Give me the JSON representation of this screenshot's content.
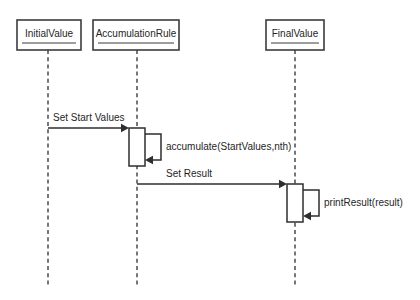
{
  "diagram": {
    "kind": "uml-sequence-diagram",
    "title": "",
    "background_color": "#ffffff",
    "stroke_color": "#2e2e2e",
    "text_color": "#1f1f1f",
    "participants": [
      {
        "id": "initial-value",
        "label": "InitialValue",
        "box": {
          "x": 17,
          "y": 20,
          "width": 64,
          "height": 30
        },
        "lifeline_x": 48,
        "lifeline_top": 50,
        "lifeline_bottom": 286
      },
      {
        "id": "accumulation-rule",
        "label": "AccumulationRule",
        "box": {
          "x": 93,
          "y": 20,
          "width": 86,
          "height": 30
        },
        "lifeline_x": 137,
        "lifeline_top": 50,
        "lifeline_bottom": 286
      },
      {
        "id": "final-value",
        "label": "FinalValue",
        "box": {
          "x": 266,
          "y": 20,
          "width": 58,
          "height": 30
        },
        "lifeline_x": 295,
        "lifeline_top": 50,
        "lifeline_bottom": 286
      }
    ],
    "activations": [
      {
        "id": "activation-accumulation-rule",
        "participant": "accumulation-rule",
        "x": 129,
        "y": 128,
        "width": 16,
        "height": 38
      },
      {
        "id": "activation-final-value",
        "participant": "final-value",
        "x": 287,
        "y": 184,
        "width": 16,
        "height": 38
      }
    ],
    "messages": [
      {
        "id": "message-set-start-values",
        "label": "Set Start Values",
        "type": "call",
        "from": "initial-value",
        "to": "accumulation-rule",
        "y": 128,
        "x_start": 48,
        "x_end": 129,
        "label_x": 53,
        "label_y": 118
      },
      {
        "id": "message-accumulate",
        "label": "accumulate(StartValues,nth)",
        "type": "self-call",
        "from": "accumulation-rule",
        "to": "accumulation-rule",
        "y_start": 134,
        "y_end": 160,
        "x_start": 145,
        "x_loop": 161,
        "label_x": 166,
        "label_y": 147
      },
      {
        "id": "message-set-result",
        "label": "Set Result",
        "type": "call",
        "from": "accumulation-rule",
        "to": "final-value",
        "y": 184,
        "x_start": 137,
        "x_end": 287,
        "label_x": 166,
        "label_y": 174
      },
      {
        "id": "message-print-result",
        "label": "printResult(result)",
        "type": "self-call",
        "from": "final-value",
        "to": "final-value",
        "y_start": 190,
        "y_end": 216,
        "x_start": 303,
        "x_loop": 319,
        "label_x": 324,
        "label_y": 203
      }
    ]
  }
}
